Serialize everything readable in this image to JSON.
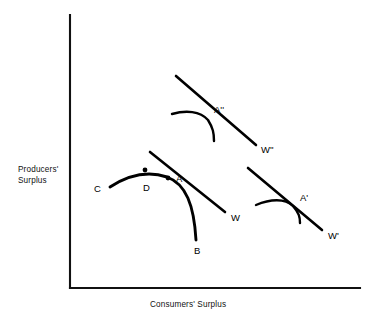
{
  "figure": {
    "background_color": "#ffffff",
    "ink_color": "#000000",
    "width": 379,
    "height": 321
  },
  "axes": {
    "y_axis_label_line1": "Producers'",
    "y_axis_label_line2": "Surplus",
    "x_axis_label": "Consumers' Surplus",
    "origin": {
      "x": 70,
      "y": 288
    },
    "y_axis_top": {
      "x": 70,
      "y": 15
    },
    "x_axis_right": {
      "x": 360,
      "y": 288
    },
    "ticks": [],
    "gridlines": false
  },
  "chart_data": {
    "type": "line",
    "title": "",
    "xlabel": "Consumers' Surplus",
    "ylabel": "Producers' Surplus",
    "xlim": [
      70,
      360
    ],
    "ylim": [
      288,
      15
    ],
    "grid": false,
    "legend": "none",
    "series": [
      {
        "name": "transformation-curve-CDAB",
        "role": "main-frontier",
        "stroke_width": 2.9,
        "labels": [
          "C",
          "D",
          "A",
          "B"
        ],
        "path": "M110,187 C127,176 146,170 167,177 C186,184 194,205 196,240",
        "endpoints": {
          "start": {
            "x": 110,
            "y": 187
          },
          "end": {
            "x": 196,
            "y": 240
          }
        }
      },
      {
        "name": "transformation-curve-A2",
        "role": "upper-frontier",
        "stroke_width": 2.4,
        "labels": [
          "A''"
        ],
        "path": "M172,114 C186,110 200,111 208,120 C213,128 214,133 214,141",
        "endpoints": {
          "start": {
            "x": 172,
            "y": 114
          },
          "end": {
            "x": 214,
            "y": 141
          }
        }
      },
      {
        "name": "transformation-curve-A1",
        "role": "lower-right-frontier",
        "stroke_width": 2.4,
        "labels": [
          "A'"
        ],
        "path": "M256,205 C270,199 285,198 293,206 C299,213 300,217 300,223",
        "endpoints": {
          "start": {
            "x": 256,
            "y": 205
          },
          "end": {
            "x": 300,
            "y": 223
          }
        }
      }
    ],
    "tangent_lines": [
      {
        "name": "iso-welfare-line-W",
        "label": "W",
        "from": {
          "x": 150,
          "y": 152
        },
        "to": {
          "x": 225,
          "y": 212
        },
        "tangency_point": {
          "x": 168,
          "y": 178
        }
      },
      {
        "name": "iso-welfare-line-W2",
        "label": "W''",
        "from": {
          "x": 176,
          "y": 76
        },
        "to": {
          "x": 256,
          "y": 145
        },
        "tangency_point": {
          "x": 207,
          "y": 118
        }
      },
      {
        "name": "iso-welfare-line-W1",
        "label": "W'",
        "from": {
          "x": 248,
          "y": 168
        },
        "to": {
          "x": 322,
          "y": 230
        },
        "tangency_point": {
          "x": 293,
          "y": 206
        }
      }
    ],
    "marked_points": [
      {
        "label": "D",
        "x": 145,
        "y": 170,
        "dot": true,
        "label_x": 143,
        "label_y": 191
      },
      {
        "label": "A",
        "x": 168,
        "y": 178,
        "dot": true,
        "label_x": 176,
        "label_y": 182
      },
      {
        "label": "C",
        "x": 110,
        "y": 187,
        "dot": false,
        "label_x": 94,
        "label_y": 192
      },
      {
        "label": "B",
        "x": 196,
        "y": 240,
        "dot": false,
        "label_x": 194,
        "label_y": 254
      },
      {
        "label": "A''",
        "x": 207,
        "y": 118,
        "dot": false,
        "label_x": 214,
        "label_y": 113
      },
      {
        "label": "A'",
        "x": 293,
        "y": 206,
        "dot": false,
        "label_x": 300,
        "label_y": 201
      }
    ],
    "line_labels": [
      {
        "label": "W",
        "x": 231,
        "y": 221
      },
      {
        "label": "W''",
        "x": 261,
        "y": 153
      },
      {
        "label": "W'",
        "x": 328,
        "y": 239
      }
    ]
  }
}
